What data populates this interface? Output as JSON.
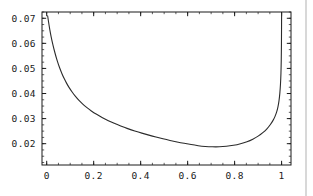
{
  "figure": {
    "background_color": "#ffffff",
    "frame_color": "#1a1a1a",
    "curve_color": "#2b2b2b",
    "page_edge_color": "#d8d8d8",
    "page_edge_x": 305
  },
  "chart_data": {
    "type": "line",
    "title": "",
    "xlabel": "",
    "ylabel": "",
    "xlim": [
      -0.02,
      1.04
    ],
    "ylim": [
      0.0115,
      0.0725
    ],
    "grid": false,
    "legend": null,
    "frame": true,
    "tick_direction": "in",
    "xticks": [
      0,
      0.2,
      0.4,
      0.6,
      0.8,
      1
    ],
    "xticklabels": [
      "0",
      "0.2",
      "0.4",
      "0.6",
      "0.8",
      "1"
    ],
    "yticks": [
      0.02,
      0.03,
      0.04,
      0.05,
      0.06,
      0.07
    ],
    "yticklabels": [
      "0.02",
      "0.03",
      "0.04",
      "0.05",
      "0.06",
      "0.07"
    ],
    "x_minor_tick_step": 0.05,
    "y_minor_tick_step": 0.0025,
    "series": [
      {
        "name": "curve",
        "x": [
          0.004,
          0.01,
          0.016,
          0.022,
          0.03,
          0.04,
          0.05,
          0.06,
          0.07,
          0.08,
          0.09,
          0.1,
          0.115,
          0.13,
          0.145,
          0.16,
          0.18,
          0.2,
          0.225,
          0.25,
          0.275,
          0.3,
          0.33,
          0.36,
          0.39,
          0.42,
          0.45,
          0.48,
          0.51,
          0.54,
          0.57,
          0.6,
          0.63,
          0.66,
          0.69,
          0.72,
          0.75,
          0.78,
          0.81,
          0.84,
          0.865,
          0.89,
          0.91,
          0.93,
          0.945,
          0.958,
          0.968,
          0.976,
          0.982,
          0.987,
          0.991,
          0.994,
          0.9965,
          0.998,
          0.999,
          0.9996,
          1.0
        ],
        "y": [
          0.071,
          0.0672,
          0.064,
          0.0612,
          0.058,
          0.0545,
          0.0515,
          0.049,
          0.0468,
          0.0449,
          0.0432,
          0.0417,
          0.0397,
          0.038,
          0.0365,
          0.0352,
          0.0337,
          0.0324,
          0.031,
          0.0297,
          0.0286,
          0.0276,
          0.0265,
          0.0255,
          0.0246,
          0.0238,
          0.023,
          0.0223,
          0.0216,
          0.021,
          0.0204,
          0.0199,
          0.0194,
          0.019,
          0.0188,
          0.0187,
          0.0188,
          0.0191,
          0.0196,
          0.0204,
          0.0212,
          0.0224,
          0.0236,
          0.0252,
          0.0267,
          0.0284,
          0.03,
          0.0318,
          0.0336,
          0.0358,
          0.0385,
          0.0418,
          0.0458,
          0.0505,
          0.056,
          0.063,
          0.072
        ]
      }
    ]
  }
}
